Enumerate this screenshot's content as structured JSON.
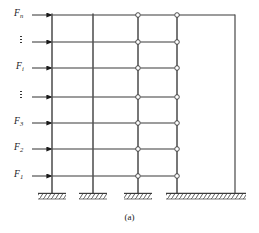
{
  "figure": {
    "caption": "(a)",
    "type": "structural-frame-shear-wall-diagram",
    "colors": {
      "line": "#3a3a3a",
      "member": "#555555",
      "text": "#1a1a1a",
      "background": "#ffffff"
    }
  },
  "force_labels": [
    {
      "id": "Fn",
      "base": "F",
      "sub": "n",
      "x": 14,
      "y": 10,
      "arrow_y": 15
    },
    {
      "id": "Fi",
      "base": "F",
      "sub": "i",
      "x": 16,
      "y": 63,
      "arrow_y": 68
    },
    {
      "id": "F3",
      "base": "F",
      "sub": "3",
      "x": 14,
      "y": 118,
      "arrow_y": 123
    },
    {
      "id": "F2",
      "base": "F",
      "sub": "2",
      "x": 14,
      "y": 144,
      "arrow_y": 149
    },
    {
      "id": "F1",
      "base": "F",
      "sub": "1",
      "x": 14,
      "y": 171,
      "arrow_y": 176
    }
  ],
  "ellipses": [
    {
      "id": "dots-upper",
      "x": 17,
      "y": 36
    },
    {
      "id": "dots-lower",
      "x": 17,
      "y": 91
    }
  ],
  "arrows": [
    {
      "id": "arrow-Fn",
      "y": 15,
      "x_start": 32,
      "x_end": 52
    },
    {
      "id": "arrow-dots-upper",
      "y": 42,
      "x_start": 32,
      "x_end": 52
    },
    {
      "id": "arrow-Fi",
      "y": 68,
      "x_start": 32,
      "x_end": 52
    },
    {
      "id": "arrow-dots-lower",
      "y": 97,
      "x_start": 32,
      "x_end": 52
    },
    {
      "id": "arrow-F3",
      "y": 123,
      "x_start": 32,
      "x_end": 52
    },
    {
      "id": "arrow-F2",
      "y": 149,
      "x_start": 32,
      "x_end": 52
    },
    {
      "id": "arrow-F1",
      "y": 176,
      "x_start": 32,
      "x_end": 52
    }
  ],
  "columns": [
    {
      "id": "column-1",
      "x": 52,
      "y_top": 15,
      "y_bottom": 193
    },
    {
      "id": "column-2",
      "x": 93,
      "y_top": 15,
      "y_bottom": 193
    },
    {
      "id": "column-3",
      "x": 138,
      "y_top": 15,
      "y_bottom": 193
    }
  ],
  "wall": {
    "id": "shear-wall",
    "x_left": 177,
    "x_right": 235,
    "y_top": 15,
    "y_bottom": 193
  },
  "beam_levels": [
    15,
    42,
    68,
    97,
    123,
    149,
    176
  ],
  "frame_beams": [
    {
      "level": 0,
      "y": 15,
      "x_start": 52,
      "x_end": 138
    },
    {
      "level": 1,
      "y": 42,
      "x_start": 52,
      "x_end": 138
    },
    {
      "level": 2,
      "y": 68,
      "x_start": 52,
      "x_end": 138
    },
    {
      "level": 3,
      "y": 97,
      "x_start": 52,
      "x_end": 138
    },
    {
      "level": 4,
      "y": 123,
      "x_start": 52,
      "x_end": 138
    },
    {
      "level": 5,
      "y": 149,
      "x_start": 52,
      "x_end": 138
    },
    {
      "level": 6,
      "y": 176,
      "x_start": 52,
      "x_end": 138
    }
  ],
  "link_beams": [
    {
      "level": 0,
      "y": 15,
      "x_start": 138,
      "x_end": 177
    },
    {
      "level": 1,
      "y": 42,
      "x_start": 138,
      "x_end": 177
    },
    {
      "level": 2,
      "y": 68,
      "x_start": 138,
      "x_end": 177
    },
    {
      "level": 3,
      "y": 97,
      "x_start": 138,
      "x_end": 177
    },
    {
      "level": 4,
      "y": 123,
      "x_start": 138,
      "x_end": 177
    },
    {
      "level": 5,
      "y": 149,
      "x_start": 138,
      "x_end": 177
    },
    {
      "level": 6,
      "y": 176,
      "x_start": 138,
      "x_end": 177
    }
  ],
  "hinges": [
    {
      "id": "hinge-L0-col3",
      "x": 138,
      "y": 15
    },
    {
      "id": "hinge-L0-wall",
      "x": 177,
      "y": 15
    },
    {
      "id": "hinge-L1-col3",
      "x": 138,
      "y": 42
    },
    {
      "id": "hinge-L1-wall",
      "x": 177,
      "y": 42
    },
    {
      "id": "hinge-L2-col3",
      "x": 138,
      "y": 68
    },
    {
      "id": "hinge-L2-wall",
      "x": 177,
      "y": 68
    },
    {
      "id": "hinge-L3-col3",
      "x": 138,
      "y": 97
    },
    {
      "id": "hinge-L3-wall",
      "x": 177,
      "y": 97
    },
    {
      "id": "hinge-L4-col3",
      "x": 138,
      "y": 123
    },
    {
      "id": "hinge-L4-wall",
      "x": 177,
      "y": 123
    },
    {
      "id": "hinge-L5-col3",
      "x": 138,
      "y": 149
    },
    {
      "id": "hinge-L5-wall",
      "x": 177,
      "y": 149
    },
    {
      "id": "hinge-L6-col3",
      "x": 138,
      "y": 176
    },
    {
      "id": "hinge-L6-wall",
      "x": 177,
      "y": 176
    }
  ],
  "supports": [
    {
      "id": "support-column-1",
      "x_left": 38,
      "x_right": 66,
      "y": 193,
      "kind": "fixed-hatched"
    },
    {
      "id": "support-column-2",
      "x_left": 79,
      "x_right": 107,
      "y": 193,
      "kind": "fixed-hatched"
    },
    {
      "id": "support-column-3",
      "x_left": 124,
      "x_right": 152,
      "y": 193,
      "kind": "fixed-hatched"
    },
    {
      "id": "support-wall",
      "x_left": 166,
      "x_right": 246,
      "y": 193,
      "kind": "fixed-hatched"
    }
  ]
}
